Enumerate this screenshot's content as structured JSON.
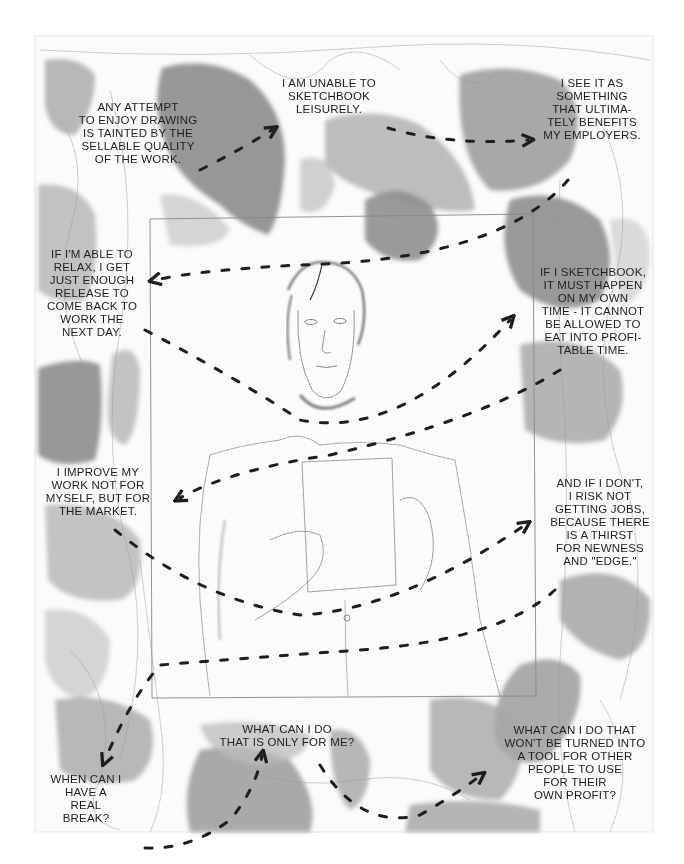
{
  "artwork": {
    "paper": {
      "x": 35,
      "y": 36,
      "width": 618,
      "height": 796,
      "color": "#fbfbfb"
    },
    "inner_frame": {
      "x": 150,
      "y": 218,
      "width": 385,
      "height": 478
    },
    "colors": {
      "ink": "#1e1e1e",
      "wash_dark": "#8a8a8a",
      "wash_mid": "#aaaaaa",
      "wash_light": "#c9c9c9",
      "pencil": "#9a9a9a"
    }
  },
  "captions": [
    {
      "id": "c1",
      "x": 52,
      "y": 101,
      "w": 172,
      "text": "ANY ATTEMPT\nTO ENJOY DRAWING\nIS TAINTED BY THE\nSELLABLE QUALITY\nOF THE WORK."
    },
    {
      "id": "c2",
      "x": 270,
      "y": 77,
      "w": 118,
      "text": "I AM UNABLE TO\nSKETCHBOOK\nLEISURELY."
    },
    {
      "id": "c3",
      "x": 530,
      "y": 77,
      "w": 124,
      "text": "I SEE IT AS\nSOMETHING\nTHAT ULTIMA-\nTELY BENEFITS\nMY EMPLOYERS."
    },
    {
      "id": "c4",
      "x": 36,
      "y": 248,
      "w": 112,
      "text": "IF I'M ABLE TO\nRELAX, I GET\nJUST ENOUGH\nRELEASE TO\nCOME BACK TO\nWORK THE\nNEXT DAY."
    },
    {
      "id": "c5",
      "x": 528,
      "y": 266,
      "w": 130,
      "text": "IF I SKETCHBOOK,\nIT MUST HAPPEN\nON MY OWN\nTIME - IT CANNOT\nBE ALLOWED TO\nEAT INTO PROFI-\nTABLE TIME."
    },
    {
      "id": "c6",
      "x": 36,
      "y": 466,
      "w": 124,
      "text": "I IMPROVE MY\nWORK NOT FOR\nMYSELF, BUT FOR\nTHE MARKET."
    },
    {
      "id": "c7",
      "x": 540,
      "y": 477,
      "w": 120,
      "text": "AND IF I DON'T,\nI RISK NOT\nGETTING JOBS,\nBECAUSE THERE\nIS A THIRST\nFOR NEWNESS\nAND \"EDGE.\""
    },
    {
      "id": "c8",
      "x": 212,
      "y": 723,
      "w": 150,
      "text": "WHAT CAN I DO\nTHAT IS ONLY FOR ME?"
    },
    {
      "id": "c9",
      "x": 490,
      "y": 724,
      "w": 170,
      "text": "WHAT CAN I DO THAT\nWON'T BE TURNED INTO\nA TOOL FOR OTHER\nPEOPLE TO USE\nFOR THEIR\nOWN PROFIT?"
    },
    {
      "id": "c10",
      "x": 40,
      "y": 773,
      "w": 92,
      "text": "WHEN CAN I\nHAVE A\nREAL\nBREAK?"
    }
  ],
  "arrows": [
    {
      "from": "c1",
      "to": "c2",
      "path": "M200 170 Q240 150 272 130",
      "head": [
        278,
        128
      ]
    },
    {
      "from": "c2",
      "to": "c3",
      "path": "M388 128 Q450 146 528 140",
      "head": [
        534,
        140
      ]
    },
    {
      "from": "c3",
      "to": "c4",
      "path": "M568 180 Q500 260 300 265 Q200 270 155 280",
      "head": [
        150,
        282
      ]
    },
    {
      "from": "c4",
      "to": "c5",
      "path": "M145 330 Q240 380 300 420 Q400 440 510 320",
      "head": [
        514,
        318
      ]
    },
    {
      "from": "c5",
      "to": "c6",
      "path": "M560 370 Q480 420 330 455 Q230 470 180 498",
      "head": [
        175,
        500
      ]
    },
    {
      "from": "c6",
      "to": "c7",
      "path": "M115 530 Q200 600 300 615 Q400 610 525 525",
      "head": [
        530,
        522
      ]
    },
    {
      "from": "c7",
      "to": "c8",
      "path": "M555 590 Q500 640 360 650 Q220 660 160 665 Q130 700 105 760",
      "head": [
        105,
        764
      ]
    },
    {
      "from": "c10",
      "to": "c8",
      "path": "M145 848 Q190 850 230 820 Q255 790 262 756",
      "head": [
        262,
        752
      ]
    },
    {
      "from": "c8",
      "to": "c9",
      "path": "M320 765 Q360 830 420 815 Q455 795 480 776",
      "head": [
        486,
        774
      ]
    }
  ]
}
